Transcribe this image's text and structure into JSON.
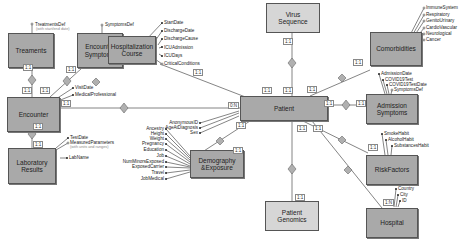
{
  "entities": {
    "treatments": "Treaments",
    "encounter_symptoms": "Encounter\nSymptoms",
    "hospitalization_course": "Hospitalization\nCourse",
    "virus_sequence": "Virus\nSequence",
    "comorbidities": "Comorbidities",
    "encounter": "Encounter",
    "patient": "Patient",
    "admission_symptoms": "Admission\nSymptoms",
    "laboratory_results": "Laboratory\nResults",
    "demography_exposure": "Demography\n&Exposure",
    "risk_factors": "RiskFactors",
    "patient_genomics": "Patient\nGenomics",
    "hospital": "Hospital"
  },
  "attributes": {
    "treatments": [
      "TreatmentsDef"
    ],
    "treatments_note": "(with start/end date)",
    "encounter_symptoms": [
      "SymptomsDef"
    ],
    "encounter": [
      "VisitDate",
      "MedicalProfessional"
    ],
    "hospitalization_course": [
      "StartDate",
      "DischargeDate",
      "DischargeCause",
      "ICUAdmission",
      "ICUDays",
      "CriticalConditions"
    ],
    "comorbidities": [
      "ImmuneSystem",
      "Respiratory",
      "GenitoUrinary",
      "CardioVascular",
      "Neurological",
      "Cancer"
    ],
    "admission_symptoms": [
      "AdmissionDate",
      "COVID19Test",
      "COVID19TestDate",
      "SymptomsDef"
    ],
    "patient": [
      "AnonymousID",
      "AgeAtDiagnosis",
      "Sex"
    ],
    "laboratory_results": [
      "TestDate",
      "MeasuredParameters",
      "LabName"
    ],
    "laboratory_results_note": "(with units and ranges)",
    "demography_exposure": [
      "Ancestry",
      "Height",
      "Weight",
      "Pregnancy",
      "Education",
      "Job",
      "NumMinorsExposed",
      "ExposedCarrier",
      "Travel",
      "JobMedical"
    ],
    "risk_factors": [
      "SmokeHabit",
      "AlcoholHabit",
      "SubstancesHabit"
    ],
    "hospital": [
      "Country",
      "City",
      "ID"
    ]
  },
  "cardinalities": {
    "treat_top": "1:1",
    "treat_bot": "1:1",
    "encsym_top": "1:1",
    "encsym_bot": "1:1",
    "enc_pat_left": "1:1",
    "enc_pat_right": "0:N",
    "enc_lab_top": "1:1",
    "enc_lab_bot": "1:1",
    "hosp_top": "1:1",
    "hosp_bot": "1:1",
    "virus_top": "1:1",
    "virus_bot": "1:1",
    "comorb_top": "1:1",
    "comorb_bot": "1:1",
    "admis_left": "1:1",
    "admis_right": "1:1",
    "demo_top": "1:1",
    "demo_bot": "1:1",
    "risk_top": "1:1",
    "risk_bot": "1:1",
    "gen_top": "1:1",
    "gen_bot": "1:1",
    "hospital_top": "1:1",
    "hospital_bot": "1:N"
  },
  "colors": {
    "entity_dark": "#a9a9a9",
    "entity_light": "#d6d6d6",
    "relationship": "#b0b0b0",
    "line": "#666666"
  }
}
